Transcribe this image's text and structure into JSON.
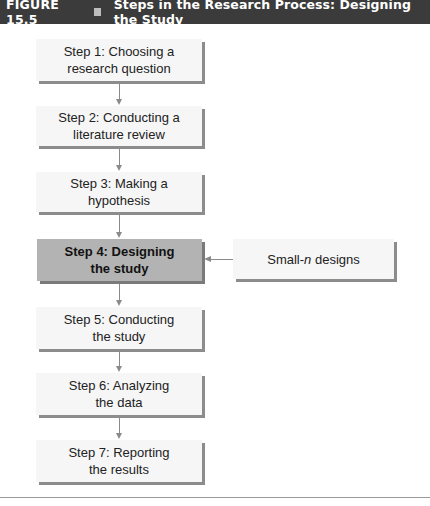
{
  "header": {
    "figure_number": "FIGURE 15.5",
    "title": "Steps in the Research Process: Designing the Study"
  },
  "steps": [
    {
      "label": "Step 1: Choosing a\nresearch question",
      "highlighted": false
    },
    {
      "label": "Step 2: Conducting a\nliterature review",
      "highlighted": false
    },
    {
      "label": "Step 3: Making a\nhypothesis",
      "highlighted": false
    },
    {
      "label": "Step 4: Designing\nthe study",
      "highlighted": true
    },
    {
      "label": "Step 5: Conducting\nthe study",
      "highlighted": false
    },
    {
      "label": "Step 6: Analyzing\nthe data",
      "highlighted": false
    },
    {
      "label": "Step 7: Reporting\nthe results",
      "highlighted": false
    }
  ],
  "side_box": {
    "prefix": "Small-",
    "italic": "n",
    "suffix": " designs",
    "points_to_step": 4
  },
  "colors": {
    "header_bg": "#3b3b3b",
    "highlight_bg": "#b3b3b3",
    "box_bg": "#f6f6f6",
    "shadow": "#8c8c8c"
  }
}
